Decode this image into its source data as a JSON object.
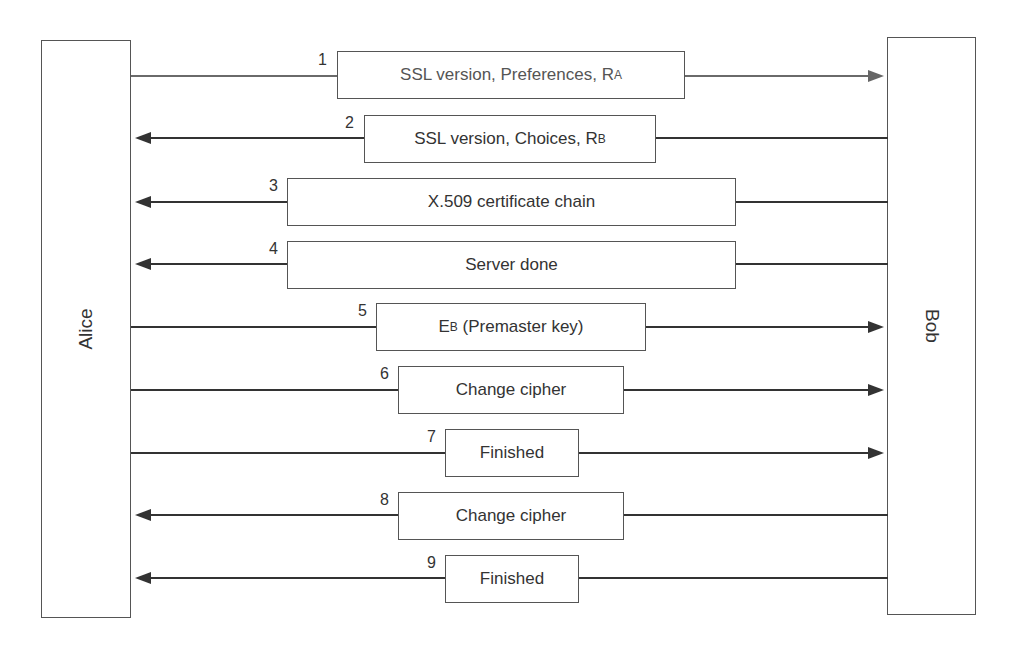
{
  "diagram": {
    "type": "sequence",
    "actors": [
      {
        "id": "alice",
        "label": "Alice"
      },
      {
        "id": "bob",
        "label": "Bob"
      }
    ],
    "messages": [
      {
        "num": "1",
        "from": "Alice",
        "to": "Bob",
        "text": "SSL version, Preferences, R",
        "sub": "A"
      },
      {
        "num": "2",
        "from": "Bob",
        "to": "Alice",
        "text": "SSL version, Choices, R",
        "sub": "B"
      },
      {
        "num": "3",
        "from": "Bob",
        "to": "Alice",
        "text": "X.509 certificate chain",
        "sub": ""
      },
      {
        "num": "4",
        "from": "Bob",
        "to": "Alice",
        "text": "Server done",
        "sub": ""
      },
      {
        "num": "5",
        "from": "Alice",
        "to": "Bob",
        "pre": "E",
        "pre_sub": "B",
        "text": " (Premaster key)"
      },
      {
        "num": "6",
        "from": "Alice",
        "to": "Bob",
        "text": "Change cipher",
        "sub": ""
      },
      {
        "num": "7",
        "from": "Alice",
        "to": "Bob",
        "text": "Finished",
        "sub": ""
      },
      {
        "num": "8",
        "from": "Bob",
        "to": "Alice",
        "text": "Change cipher",
        "sub": ""
      },
      {
        "num": "9",
        "from": "Bob",
        "to": "Alice",
        "text": "Finished",
        "sub": ""
      }
    ]
  }
}
